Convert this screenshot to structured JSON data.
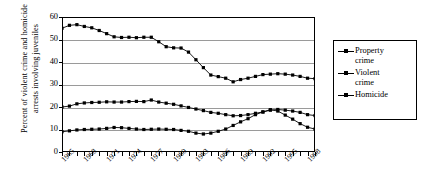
{
  "chart_data": {
    "type": "line",
    "title": "",
    "xlabel": "",
    "ylabel_line1": "Percent of violent crime and homicide",
    "ylabel_line2": "arrests involving juveniles",
    "ylim": [
      0,
      60
    ],
    "yticks": [
      0,
      10,
      20,
      30,
      40,
      50,
      60
    ],
    "grid": true,
    "legend_position": "right",
    "x": [
      1965,
      1966,
      1967,
      1968,
      1969,
      1970,
      1971,
      1972,
      1973,
      1974,
      1975,
      1976,
      1977,
      1978,
      1979,
      1980,
      1981,
      1982,
      1983,
      1984,
      1985,
      1986,
      1987,
      1988,
      1989,
      1990,
      1991,
      1992,
      1993,
      1994,
      1995,
      1996,
      1997,
      1998,
      1999
    ],
    "xtick_labels": [
      "1965",
      "1968",
      "1971",
      "1974",
      "1977",
      "1980",
      "1983",
      "1986",
      "1989",
      "1992",
      "1995",
      "1998"
    ],
    "xtick_years": [
      1965,
      1968,
      1971,
      1974,
      1977,
      1980,
      1983,
      1986,
      1989,
      1992,
      1995,
      1998
    ],
    "series": [
      {
        "name": "Property crime",
        "legend_label": "Property\ncrime",
        "color": "#000000",
        "marker": "square",
        "values": [
          55.0,
          56.3,
          56.6,
          55.8,
          55.2,
          54.0,
          52.6,
          51.2,
          50.9,
          51.0,
          50.8,
          51.0,
          51.0,
          49.0,
          46.8,
          46.3,
          46.2,
          44.4,
          41.0,
          37.5,
          34.2,
          33.5,
          32.8,
          31.2,
          32.2,
          32.8,
          33.6,
          34.4,
          34.6,
          34.8,
          34.6,
          34.2,
          33.6,
          32.8,
          32.6
        ]
      },
      {
        "name": "Violent crime",
        "legend_label": "Violent\ncrime",
        "color": "#000000",
        "marker": "square",
        "values": [
          20.0,
          20.4,
          21.4,
          21.8,
          22.0,
          22.1,
          22.3,
          22.2,
          22.2,
          22.4,
          22.5,
          22.4,
          23.1,
          22.2,
          21.7,
          21.2,
          20.5,
          19.8,
          19.1,
          18.4,
          17.6,
          17.2,
          16.6,
          16.1,
          16.2,
          16.6,
          17.2,
          17.8,
          18.6,
          18.9,
          18.6,
          18.2,
          17.6,
          16.6,
          16.2
        ]
      },
      {
        "name": "Homicide",
        "legend_label": "Homicide",
        "color": "#000000",
        "marker": "square",
        "values": [
          9.0,
          9.4,
          9.8,
          10.0,
          10.1,
          10.2,
          10.5,
          10.9,
          10.8,
          10.5,
          10.2,
          10.0,
          10.1,
          10.2,
          10.1,
          10.0,
          9.6,
          9.2,
          8.4,
          8.0,
          8.4,
          9.2,
          10.2,
          11.8,
          13.4,
          14.8,
          16.6,
          17.8,
          18.8,
          18.2,
          16.4,
          14.6,
          12.6,
          11.0,
          10.2
        ]
      }
    ]
  }
}
